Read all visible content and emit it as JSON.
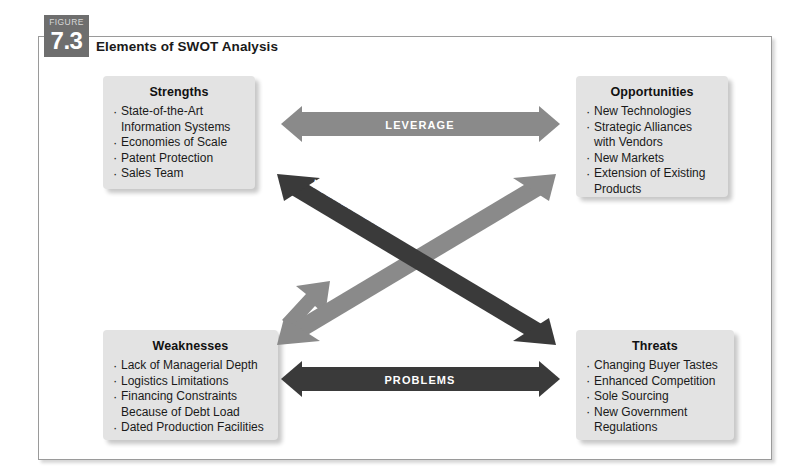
{
  "figure": {
    "badge_word": "FIGURE",
    "number": "7.3",
    "title": "Elements of SWOT Analysis"
  },
  "colors": {
    "frame_border": "#9a9a9a",
    "box_fill": "#e3e3e3",
    "arrow_light": "#8a8a8a",
    "arrow_dark": "#3a3a3a",
    "badge_bg": "#6e6e6e",
    "text": "#1a1a1a",
    "arrow_label_text": "#ffffff"
  },
  "quadrants": {
    "strengths": {
      "title": "Strengths",
      "items": [
        "State-of-the-Art\nInformation Systems",
        "Economies of Scale",
        "Patent Protection",
        "Sales Team"
      ]
    },
    "opportunities": {
      "title": "Opportunities",
      "items": [
        "New Technologies",
        "Strategic Alliances\nwith Vendors",
        "New Markets",
        "Extension of Existing\nProducts"
      ]
    },
    "weaknesses": {
      "title": "Weaknesses",
      "items": [
        "Lack of Managerial Depth",
        "Logistics Limitations",
        "Financing Constraints\nBecause of Debt Load",
        "Dated Production Facilities"
      ]
    },
    "threats": {
      "title": "Threats",
      "items": [
        "Changing Buyer Tastes",
        "Enhanced Competition",
        "Sole Sourcing",
        "New Government\nRegulations"
      ]
    }
  },
  "connectors": {
    "leverage": {
      "label": "LEVERAGE",
      "color": "#8a8a8a",
      "orientation": "horizontal-top",
      "connects": [
        "Strengths",
        "Opportunities"
      ]
    },
    "problems": {
      "label": "PROBLEMS",
      "color": "#3a3a3a",
      "orientation": "horizontal-bottom",
      "connects": [
        "Weaknesses",
        "Threats"
      ]
    },
    "vulnerability": {
      "label": "VULNERABILITY",
      "color": "#3a3a3a",
      "orientation": "diagonal-down-right",
      "connects": [
        "Strengths",
        "Threats"
      ]
    },
    "constraints": {
      "label": "CONSTRAINTS",
      "color": "#8a8a8a",
      "orientation": "diagonal-up-right",
      "connects": [
        "Weaknesses",
        "Opportunities"
      ]
    }
  }
}
